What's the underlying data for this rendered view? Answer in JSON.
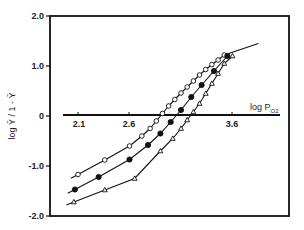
{
  "chart_data": {
    "type": "scatter",
    "title": "",
    "xlabel": "log P_O2",
    "ylabel": "log Ȳ / 1 - Ȳ",
    "xlim": [
      1.95,
      4.05
    ],
    "ylim": [
      -2.0,
      2.0
    ],
    "x_ticks": [
      {
        "value": 2.1,
        "label": "2.1"
      },
      {
        "value": 2.6,
        "label": "2.6"
      },
      {
        "value": 3.6,
        "label": "3.6"
      }
    ],
    "y_ticks": [
      {
        "value": 2.0,
        "label": "2.0"
      },
      {
        "value": 1.0,
        "label": "1.0"
      },
      {
        "value": 0,
        "label": "0"
      },
      {
        "value": -1.0,
        "label": "-1.0"
      },
      {
        "value": -2.0,
        "label": "-2.0"
      }
    ],
    "grid": false,
    "legend": null,
    "series": [
      {
        "name": "open circles",
        "marker": "circle-open",
        "x": [
          2.1,
          2.36,
          2.6,
          2.72,
          2.8,
          2.86,
          2.92,
          2.98,
          3.04,
          3.1,
          3.16,
          3.22,
          3.28,
          3.34,
          3.4,
          3.46,
          3.52
        ],
        "y": [
          -1.17,
          -0.88,
          -0.6,
          -0.4,
          -0.25,
          -0.1,
          0.05,
          0.2,
          0.33,
          0.46,
          0.58,
          0.7,
          0.82,
          0.93,
          1.03,
          1.12,
          1.22
        ]
      },
      {
        "name": "filled circles",
        "marker": "circle-filled",
        "x": [
          2.07,
          2.3,
          2.6,
          2.78,
          2.9,
          3.0,
          3.1,
          3.2,
          3.3,
          3.42,
          3.55
        ],
        "y": [
          -1.47,
          -1.22,
          -0.87,
          -0.58,
          -0.35,
          -0.12,
          0.12,
          0.38,
          0.62,
          0.9,
          1.2
        ]
      },
      {
        "name": "open triangles",
        "marker": "triangle-open",
        "x": [
          2.06,
          2.36,
          2.65,
          2.9,
          3.02,
          3.1,
          3.16,
          3.22,
          3.28,
          3.34,
          3.4,
          3.46,
          3.52,
          3.6
        ],
        "y": [
          -1.72,
          -1.48,
          -1.25,
          -0.7,
          -0.45,
          -0.25,
          -0.08,
          0.08,
          0.25,
          0.45,
          0.65,
          0.85,
          1.05,
          1.2
        ]
      }
    ],
    "fit_line_end": {
      "x": 3.85,
      "y": 1.45
    }
  }
}
